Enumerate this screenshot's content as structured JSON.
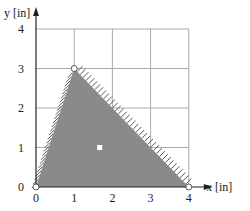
{
  "chart_data": {
    "type": "area",
    "title": "",
    "xlabel": "x [in]",
    "ylabel": "y [in]",
    "xlim": [
      0,
      4
    ],
    "ylim": [
      0,
      4
    ],
    "x_ticks": [
      "0",
      "1",
      "2",
      "3",
      "4"
    ],
    "y_ticks": [
      "0",
      "1",
      "2",
      "3",
      "4"
    ],
    "grid": true,
    "shaded_region": {
      "shape": "triangle",
      "vertices": [
        [
          0,
          0
        ],
        [
          1,
          3
        ],
        [
          4,
          0
        ]
      ],
      "fill_color": "#8a8a8a",
      "hatched_edges": [
        [
          [
            0,
            0
          ],
          [
            1,
            3
          ]
        ],
        [
          [
            1,
            3
          ],
          [
            4,
            0
          ]
        ]
      ]
    },
    "points": [
      {
        "name": "vertex-origin",
        "x": 0,
        "y": 0,
        "style": "open-circle"
      },
      {
        "name": "vertex-top",
        "x": 1,
        "y": 3,
        "style": "open-circle"
      },
      {
        "name": "vertex-right",
        "x": 4,
        "y": 0,
        "style": "open-circle"
      },
      {
        "name": "centroid",
        "x": 1.667,
        "y": 1,
        "style": "white-square"
      }
    ],
    "legend": null
  },
  "colors": {
    "fill": "#8a8a8a",
    "grid": "#aaaaaa",
    "axis": "#222222",
    "hatch": "#555555"
  }
}
